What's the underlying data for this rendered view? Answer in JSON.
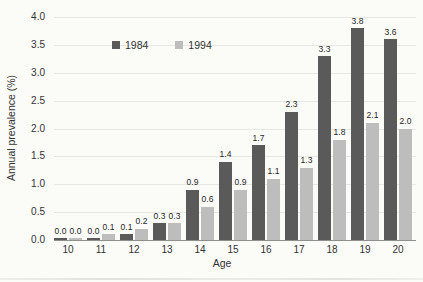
{
  "chart_data": {
    "type": "bar",
    "categories": [
      "10",
      "11",
      "12",
      "13",
      "14",
      "15",
      "16",
      "17",
      "18",
      "19",
      "20"
    ],
    "series": [
      {
        "name": "1984",
        "color": "#5a5a5a",
        "values": [
          0.0,
          0.0,
          0.1,
          0.3,
          0.9,
          1.4,
          1.7,
          2.3,
          3.3,
          3.8,
          3.6
        ]
      },
      {
        "name": "1994",
        "color": "#bdbdbd",
        "values": [
          0.0,
          0.1,
          0.2,
          0.3,
          0.6,
          0.9,
          1.1,
          1.3,
          1.8,
          2.1,
          2.0
        ]
      }
    ],
    "title": "",
    "xlabel": "Age",
    "ylabel": "Annual prevalence (%)",
    "ylim": [
      0,
      4.0
    ],
    "ytick_step": 0.5,
    "grid": true,
    "legend_position": "inside-top-center",
    "value_labels": true
  },
  "axes": {
    "y_ticks": [
      "4.0",
      "3.5",
      "3.0",
      "2.5",
      "2.0",
      "1.5",
      "1.0",
      "0.5",
      "0.0"
    ],
    "x_ticks": [
      "10",
      "11",
      "12",
      "13",
      "14",
      "15",
      "16",
      "17",
      "18",
      "19",
      "20"
    ]
  }
}
